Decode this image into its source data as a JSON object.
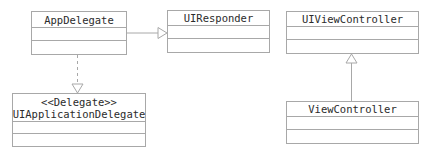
{
  "diagram": {
    "type": "uml-class-diagram",
    "colors": {
      "line": "#a8a8a8",
      "text": "#2b2b2b",
      "background": "#ffffff"
    },
    "classes": [
      {
        "id": "app_delegate",
        "name": "AppDelegate",
        "stereotype": ""
      },
      {
        "id": "ui_responder",
        "name": "UIResponder",
        "stereotype": ""
      },
      {
        "id": "ui_view_controller",
        "name": "UIViewController",
        "stereotype": ""
      },
      {
        "id": "ui_application_delegate",
        "name": "UIApplicationDelegate",
        "stereotype": "<<Delegate>>"
      },
      {
        "id": "view_controller",
        "name": "ViewController",
        "stereotype": ""
      }
    ],
    "relationships": [
      {
        "from": "AppDelegate",
        "to": "UIResponder",
        "kind": "generalization",
        "line": "solid",
        "arrow": "hollow-triangle"
      },
      {
        "from": "AppDelegate",
        "to": "UIApplicationDelegate",
        "kind": "realization",
        "line": "dashed",
        "arrow": "hollow-triangle"
      },
      {
        "from": "ViewController",
        "to": "UIViewController",
        "kind": "generalization",
        "line": "solid",
        "arrow": "hollow-triangle"
      }
    ]
  }
}
